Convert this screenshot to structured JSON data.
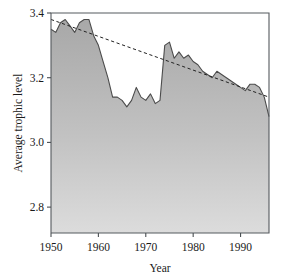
{
  "chart_data": {
    "type": "area",
    "title": "",
    "xlabel": "Year",
    "ylabel": "Average trophic level",
    "xlim": [
      1950,
      1996
    ],
    "ylim": [
      2.72,
      3.4
    ],
    "grid": false,
    "legend": "none",
    "x_ticks": [
      1950,
      1960,
      1970,
      1980,
      1990
    ],
    "x_tick_labels": [
      "1950",
      "1960",
      "1970",
      "1980",
      "1990"
    ],
    "y_ticks": [
      2.8,
      3.0,
      3.2,
      3.4
    ],
    "y_tick_labels": [
      "2.8",
      "3.0",
      "3.2",
      "3.4"
    ],
    "fill_color": "#b0b0b0",
    "line_color": "#4c4c4c",
    "trend_color": "#222222",
    "series": [
      {
        "name": "Average trophic level",
        "style": "filled area with outline",
        "x": [
          1950,
          1951,
          1952,
          1953,
          1954,
          1955,
          1956,
          1957,
          1958,
          1959,
          1960,
          1961,
          1962,
          1963,
          1964,
          1965,
          1966,
          1967,
          1968,
          1969,
          1970,
          1971,
          1972,
          1973,
          1974,
          1975,
          1976,
          1977,
          1978,
          1979,
          1980,
          1981,
          1982,
          1983,
          1984,
          1985,
          1986,
          1987,
          1988,
          1989,
          1990,
          1991,
          1992,
          1993,
          1994,
          1995,
          1996
        ],
        "values": [
          3.35,
          3.34,
          3.37,
          3.38,
          3.36,
          3.34,
          3.37,
          3.38,
          3.38,
          3.33,
          3.3,
          3.25,
          3.2,
          3.14,
          3.14,
          3.13,
          3.11,
          3.13,
          3.17,
          3.14,
          3.13,
          3.15,
          3.12,
          3.13,
          3.3,
          3.31,
          3.26,
          3.28,
          3.26,
          3.27,
          3.25,
          3.24,
          3.22,
          3.21,
          3.2,
          3.22,
          3.21,
          3.2,
          3.19,
          3.18,
          3.17,
          3.16,
          3.18,
          3.18,
          3.17,
          3.14,
          3.08
        ]
      },
      {
        "name": "Linear trend",
        "style": "dashed",
        "x": [
          1950,
          1996
        ],
        "values": [
          3.38,
          3.14
        ]
      }
    ]
  },
  "axes": {
    "x_axis_title": "Year",
    "y_axis_title": "Average trophic level"
  }
}
